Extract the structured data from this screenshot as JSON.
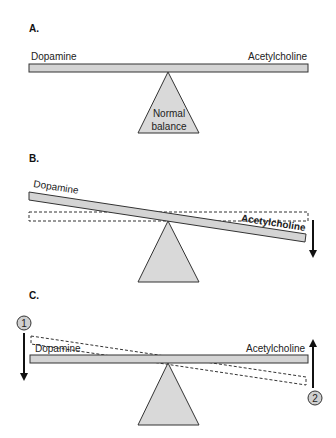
{
  "figure": {
    "panels": [
      {
        "id": "A",
        "label": "A.",
        "left_label": "Dopamine",
        "right_label": "Acetylcholine",
        "fulcrum_label_line1": "Normal",
        "fulcrum_label_line2": "balance",
        "state": "balanced"
      },
      {
        "id": "B",
        "label": "B.",
        "left_label": "Dopamine",
        "right_label": "Acetylcholine",
        "state": "tilted toward acetylcholine",
        "arrow": "down-right"
      },
      {
        "id": "C",
        "label": "C.",
        "left_label": "Dopamine",
        "right_label": "Acetylcholine",
        "state": "restored balance",
        "step1_marker": "1",
        "step2_marker": "2",
        "arrow_left": "down",
        "arrow_right": "up"
      }
    ],
    "colors": {
      "beam_fill": "#d4d4d4",
      "fulcrum_fill": "#d9d9d9",
      "stroke": "#333333",
      "marker_fill": "#cfcfcf"
    }
  }
}
